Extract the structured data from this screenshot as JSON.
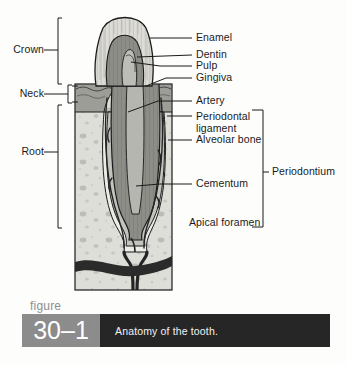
{
  "figure": {
    "word": "figure",
    "number": "30–1",
    "caption": "Anatomy of the tooth.",
    "number_block_color": "#8c8c8c",
    "caption_block_color": "#262626",
    "caption_text_color": "#f2f2f2"
  },
  "diagram": {
    "title": "Anatomy of the tooth",
    "type": "labeled-anatomical-cross-section",
    "background": "#fdfdfc",
    "line_color": "#1b1b1b",
    "regions": {
      "enamel_fill": "#d9d9d4",
      "dentin_fill": "#8a8a8a",
      "pulp_fill": "#b9b9b4",
      "gingiva_fill": "#9a9a95",
      "bone_fill": "#dcdcd7",
      "bone_speckle": "#b3b3ad",
      "cementum_fill": "#c6c6c1",
      "ligament_fill": "#efefea",
      "vessel_color": "#2b2b2b"
    }
  },
  "labels_left": [
    {
      "id": "crown",
      "text": "Crown",
      "x": 10,
      "y": 45,
      "bracket_top": 18,
      "bracket_bottom": 84
    },
    {
      "id": "neck",
      "text": "Neck",
      "x": 13,
      "y": 85,
      "bracket_top": 84,
      "bracket_bottom": 104
    },
    {
      "id": "root",
      "text": "Root",
      "x": 15,
      "y": 147,
      "bracket_top": 104,
      "bracket_bottom": 228
    }
  ],
  "labels_right": [
    {
      "id": "enamel",
      "text": "Enamel",
      "x": 195,
      "y": 33
    },
    {
      "id": "dentin",
      "text": "Dentin",
      "x": 195,
      "y": 50
    },
    {
      "id": "pulp",
      "text": "Pulp",
      "x": 195,
      "y": 62
    },
    {
      "id": "gingiva",
      "text": "Gingiva",
      "x": 195,
      "y": 73
    },
    {
      "id": "artery",
      "text": "Artery",
      "x": 195,
      "y": 96
    },
    {
      "id": "periodontal-ligament",
      "text": "Periodontal ligament",
      "x": 195,
      "y": 108
    },
    {
      "id": "alveolar-bone",
      "text": "Alveolar bone",
      "x": 195,
      "y": 135
    },
    {
      "id": "cementum",
      "text": "Cementum",
      "x": 195,
      "y": 179
    },
    {
      "id": "apical-foramen",
      "text": "Apical foramen",
      "x": 188,
      "y": 218
    }
  ],
  "labels_far_right": [
    {
      "id": "periodontium",
      "text": "Periodontium",
      "x": 272,
      "y": 167,
      "bracket_top": 110,
      "bracket_bottom": 227
    }
  ]
}
